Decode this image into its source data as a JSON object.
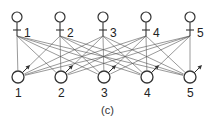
{
  "diagram": {
    "caption": "(c)",
    "top_nodes": [
      {
        "label": "1",
        "x": 17
      },
      {
        "label": "2",
        "x": 60
      },
      {
        "label": "3",
        "x": 103
      },
      {
        "label": "4",
        "x": 146
      },
      {
        "label": "5",
        "x": 190
      }
    ],
    "bottom_nodes": [
      {
        "label": "1",
        "x": 18
      },
      {
        "label": "2",
        "x": 61
      },
      {
        "label": "3",
        "x": 104
      },
      {
        "label": "4",
        "x": 147
      },
      {
        "label": "5",
        "x": 190
      }
    ],
    "top_y": 17,
    "bottom_y": 77,
    "connection": "complete bipartite: each top node (neuron) connects to every bottom node",
    "line_color": "#555555",
    "stroke_color": "#333333"
  }
}
